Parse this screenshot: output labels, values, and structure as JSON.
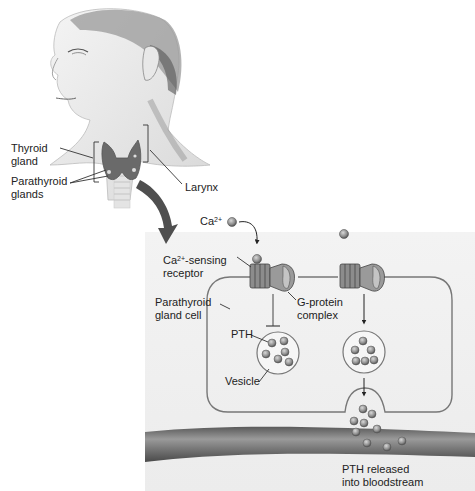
{
  "figure": {
    "labels": {
      "thyroid_gland_1": "Thyroid",
      "thyroid_gland_2": "gland",
      "parathyroid_glands_1": "Parathyroid",
      "parathyroid_glands_2": "glands",
      "larynx": "Larynx",
      "calcium_ion": "Ca",
      "calcium_charge": "2+",
      "receptor_prefix": "Ca",
      "receptor_charge": "2+",
      "receptor_suffix": "-sensing",
      "receptor_2": "receptor",
      "cell_1": "Parathyroid",
      "cell_2": "gland cell",
      "gprotein_1": "G-protein",
      "gprotein_2": "complex",
      "pth": "PTH",
      "vesicle": "Vesicle",
      "released_1": "PTH released",
      "released_2": "into bloodstream"
    },
    "colors": {
      "panel_bg": "#eeeeee",
      "membrane": "#777777",
      "particle": "#9a9a9a",
      "blood_vessel": "#707070",
      "gland": "#6a6a6a"
    }
  }
}
